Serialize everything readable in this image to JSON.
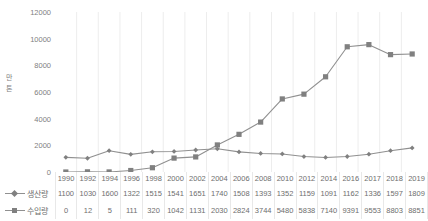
{
  "chart_data": {
    "type": "line",
    "title": "",
    "xlabel": "",
    "ylabel": "만 톤",
    "ylim": [
      0,
      12000
    ],
    "ytick_labels": [
      "12000",
      "10000",
      "8000",
      "6000",
      "4000",
      "2000",
      "0"
    ],
    "yticks": [
      12000,
      10000,
      8000,
      6000,
      4000,
      2000,
      0
    ],
    "grid": "vertical",
    "legend_position": "bottom-left-table",
    "categories": [
      "1990",
      "1992",
      "1994",
      "1996",
      "1998",
      "2000",
      "2002",
      "2004",
      "2006",
      "2008",
      "2010",
      "2012",
      "2014",
      "2016",
      "2017",
      "2018",
      "2019"
    ],
    "series": [
      {
        "name": "생산량",
        "marker": "diamond",
        "color": "#808080",
        "values": [
          1100,
          1030,
          1600,
          1322,
          1515,
          1541,
          1651,
          1740,
          1508,
          1393,
          1352,
          1159,
          1091,
          1162,
          1336,
          1597,
          1809
        ]
      },
      {
        "name": "수입량",
        "marker": "square",
        "color": "#808080",
        "values": [
          0,
          12,
          5,
          111,
          320,
          1042,
          1131,
          2030,
          2824,
          3744,
          5480,
          5838,
          7140,
          9391,
          9553,
          8803,
          8851
        ]
      }
    ]
  },
  "axis": {
    "y_title_chars": [
      "만",
      "톤"
    ]
  },
  "table": {
    "header_blank": "",
    "row_labels": [
      "생산량",
      "수입량"
    ]
  },
  "colors": {
    "line": "#909090",
    "marker": "#808080",
    "gridline": "#ededed",
    "text": "#808080",
    "background": "#ffffff"
  }
}
